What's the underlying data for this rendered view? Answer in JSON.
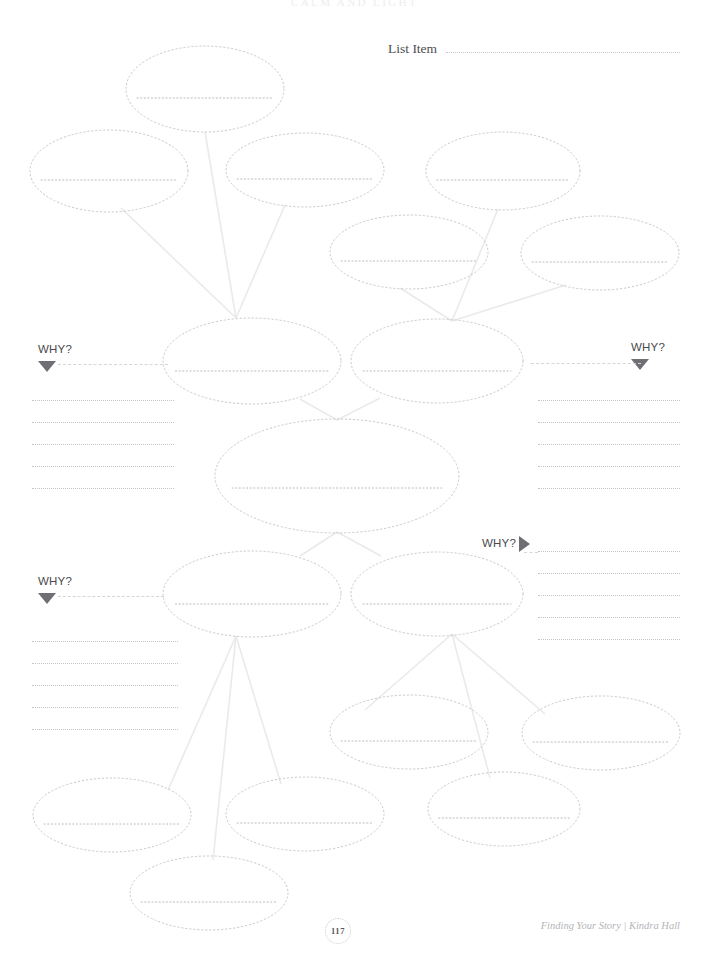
{
  "page": {
    "chapter_title": "CALM AND LIGHT",
    "page_number": "117",
    "attribution": "Finding Your Story | Kindra Hall",
    "background_color": "#ffffff",
    "width": 709,
    "height": 962
  },
  "header": {
    "list_item_label": "List Item"
  },
  "why_markers": [
    {
      "id": "why-top-left",
      "label": "WHY?",
      "arrow": "triangle-down",
      "x": 38,
      "y": 344
    },
    {
      "id": "why-top-right",
      "label": "WHY?",
      "arrow": "triangle-down",
      "x": 631,
      "y": 342
    },
    {
      "id": "why-mid-right",
      "label": "WHY?",
      "arrow": "triangle-right",
      "x": 482,
      "y": 536
    },
    {
      "id": "why-bottom-left",
      "label": "WHY?",
      "arrow": "triangle-down",
      "x": 38,
      "y": 576
    }
  ],
  "note_line_groups": [
    {
      "id": "notes-top-left",
      "x": 32,
      "y": 400,
      "width": 142,
      "lines": 5,
      "spacing": 22
    },
    {
      "id": "notes-top-right",
      "x": 538,
      "y": 400,
      "width": 142,
      "lines": 5,
      "spacing": 22
    },
    {
      "id": "notes-bottom-left",
      "x": 32,
      "y": 641,
      "width": 146,
      "lines": 5,
      "spacing": 22
    },
    {
      "id": "notes-bottom-right",
      "x": 538,
      "y": 551,
      "width": 142,
      "lines": 5,
      "spacing": 22
    }
  ],
  "ellipses": [
    {
      "id": "node-top-center",
      "cx": 205,
      "cy": 89,
      "rx": 79,
      "ry": 43,
      "write_line_y_offset": 9
    },
    {
      "id": "node-upper-left-far",
      "cx": 109,
      "cy": 171,
      "rx": 79,
      "ry": 41,
      "write_line_y_offset": 9
    },
    {
      "id": "node-upper-left-inner",
      "cx": 305,
      "cy": 170,
      "rx": 79,
      "ry": 37,
      "write_line_y_offset": 9
    },
    {
      "id": "node-upper-right-inner",
      "cx": 503,
      "cy": 171,
      "rx": 77,
      "ry": 39,
      "write_line_y_offset": 9
    },
    {
      "id": "node-upper-mid-a",
      "cx": 409,
      "cy": 252,
      "rx": 79,
      "ry": 37,
      "write_line_y_offset": 9
    },
    {
      "id": "node-upper-right-far",
      "cx": 600,
      "cy": 253,
      "rx": 79,
      "ry": 37,
      "write_line_y_offset": 9
    },
    {
      "id": "node-core-left",
      "cx": 252,
      "cy": 361,
      "rx": 89,
      "ry": 43,
      "write_line_y_offset": 10
    },
    {
      "id": "node-core-right",
      "cx": 437,
      "cy": 361,
      "rx": 86,
      "ry": 42,
      "write_line_y_offset": 10
    },
    {
      "id": "node-center-main",
      "cx": 337,
      "cy": 476,
      "rx": 122,
      "ry": 57,
      "write_line_y_offset": 12
    },
    {
      "id": "node-lower-left",
      "cx": 252,
      "cy": 594,
      "rx": 89,
      "ry": 43,
      "write_line_y_offset": 10
    },
    {
      "id": "node-lower-right",
      "cx": 437,
      "cy": 594,
      "rx": 86,
      "ry": 42,
      "write_line_y_offset": 10
    },
    {
      "id": "node-bottom-mid-a",
      "cx": 409,
      "cy": 732,
      "rx": 79,
      "ry": 37,
      "write_line_y_offset": 9
    },
    {
      "id": "node-bottom-right-far",
      "cx": 601,
      "cy": 733,
      "rx": 79,
      "ry": 37,
      "write_line_y_offset": 9
    },
    {
      "id": "node-bottom-left-far",
      "cx": 112,
      "cy": 815,
      "rx": 79,
      "ry": 37,
      "write_line_y_offset": 9
    },
    {
      "id": "node-bottom-left-inner",
      "cx": 305,
      "cy": 814,
      "rx": 79,
      "ry": 37,
      "write_line_y_offset": 9
    },
    {
      "id": "node-bottom-right-mid",
      "cx": 504,
      "cy": 809,
      "rx": 76,
      "ry": 37,
      "write_line_y_offset": 9
    },
    {
      "id": "node-bottom-center",
      "cx": 209,
      "cy": 893,
      "rx": 79,
      "ry": 37,
      "write_line_y_offset": 9
    }
  ],
  "connectors": [
    {
      "id": "c1",
      "x1": 205,
      "y1": 132,
      "x2": 236,
      "y2": 318
    },
    {
      "id": "c2",
      "x1": 121,
      "y1": 208,
      "x2": 236,
      "y2": 318
    },
    {
      "id": "c3",
      "x1": 285,
      "y1": 205,
      "x2": 236,
      "y2": 318
    },
    {
      "id": "c4",
      "x1": 498,
      "y1": 209,
      "x2": 452,
      "y2": 321
    },
    {
      "id": "c5",
      "x1": 400,
      "y1": 288,
      "x2": 452,
      "y2": 321
    },
    {
      "id": "c6",
      "x1": 566,
      "y1": 285,
      "x2": 452,
      "y2": 321
    },
    {
      "id": "c7",
      "x1": 300,
      "y1": 399,
      "x2": 337,
      "y2": 420
    },
    {
      "id": "c8",
      "x1": 380,
      "y1": 398,
      "x2": 337,
      "y2": 420
    },
    {
      "id": "c9",
      "x1": 337,
      "y1": 532,
      "x2": 300,
      "y2": 556
    },
    {
      "id": "c10",
      "x1": 337,
      "y1": 532,
      "x2": 381,
      "y2": 556
    },
    {
      "id": "c11",
      "x1": 236,
      "y1": 636,
      "x2": 168,
      "y2": 790
    },
    {
      "id": "c12",
      "x1": 236,
      "y1": 636,
      "x2": 213,
      "y2": 860
    },
    {
      "id": "c13",
      "x1": 236,
      "y1": 636,
      "x2": 281,
      "y2": 784
    },
    {
      "id": "c14",
      "x1": 452,
      "y1": 634,
      "x2": 365,
      "y2": 710
    },
    {
      "id": "c15",
      "x1": 452,
      "y1": 634,
      "x2": 545,
      "y2": 714
    },
    {
      "id": "c16",
      "x1": 452,
      "y1": 634,
      "x2": 490,
      "y2": 778
    }
  ],
  "colors": {
    "connector": "#eaeaec",
    "ellipse_stroke": "#c9c9cd",
    "write_line": "#bcbcc0",
    "rule_line": "#c4c4c8",
    "arrow": "#6f6f73",
    "text": "#4a4a4d",
    "attribution": "#b4b4b8"
  }
}
